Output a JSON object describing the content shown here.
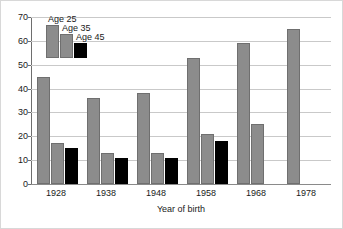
{
  "chart_data": {
    "type": "bar",
    "title": "",
    "xlabel": "Year of birth",
    "ylabel": "",
    "categories": [
      "1928",
      "1938",
      "1948",
      "1958",
      "1968",
      "1978"
    ],
    "series": [
      {
        "name": "Age 25",
        "color": "#8c8c8c",
        "values": [
          45,
          36,
          38,
          53,
          59,
          65
        ]
      },
      {
        "name": "Age 35",
        "color": "#8c8c8c",
        "values": [
          17,
          13,
          13,
          21,
          25,
          null
        ]
      },
      {
        "name": "Age 45",
        "color": "#000000",
        "values": [
          15,
          11,
          11,
          18,
          null,
          null
        ]
      }
    ],
    "ylim": [
      0,
      70
    ],
    "yticks": [
      0,
      10,
      20,
      30,
      40,
      50,
      60,
      70
    ],
    "ytick_labels": [
      "0",
      "10",
      "20",
      "30",
      "40",
      "50",
      "60",
      "70"
    ],
    "grid": true,
    "grid_axis": "y",
    "legend_position": "upper-left-inside",
    "legend_entries": [
      "Age 25",
      "Age 35",
      "Age 45"
    ]
  },
  "figure": {
    "background_color": "#ffffff",
    "border_color": "#d8d8d8",
    "gridline_color": "#c9c9c9",
    "axis_color": "#6e6e6e",
    "text_color": "#1a1a1a"
  }
}
